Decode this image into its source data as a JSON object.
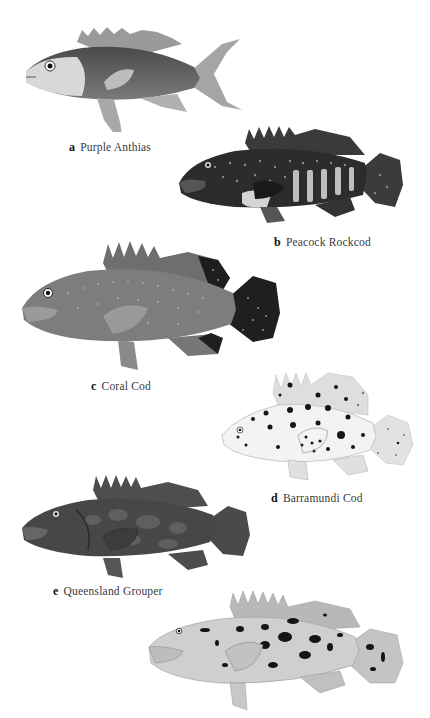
{
  "plate": {
    "entries": [
      {
        "letter": "a",
        "name": "Purple Anthias",
        "pattern": "plain-gradient",
        "tone": "#6e6e6e"
      },
      {
        "letter": "b",
        "name": "Peacock Rockcod",
        "pattern": "dark-spotted-with-pale-bars",
        "tone": "#2f2f2f"
      },
      {
        "letter": "c",
        "name": "Coral Cod",
        "pattern": "fine-pale-spots-dark-fin-edges",
        "tone": "#777777"
      },
      {
        "letter": "d",
        "name": "Barramundi Cod",
        "pattern": "pale-with-black-spots",
        "tone": "#eeeeee"
      },
      {
        "letter": "e",
        "name": "Queensland Grouper",
        "pattern": "dark-mottled",
        "tone": "#4c4c4c"
      },
      {
        "letter": "f",
        "name": "",
        "pattern": "pale-with-black-blotches",
        "tone": "#c8c8c8"
      }
    ]
  }
}
